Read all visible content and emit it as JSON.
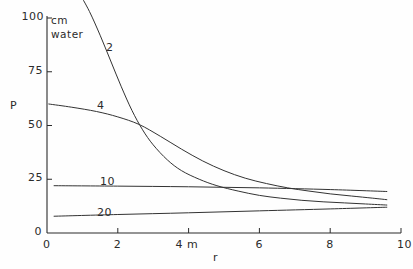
{
  "chart_data": {
    "type": "line",
    "title": "",
    "xlabel": "r",
    "ylabel": "P",
    "x_unit": "m",
    "y_unit": "cm water",
    "xlim": [
      0,
      10
    ],
    "ylim": [
      0,
      100
    ],
    "grid": false,
    "legend": "inline-curve-labels",
    "xticks": [
      "0",
      "2",
      "4 m",
      "6",
      "8",
      "10"
    ],
    "xtick_values": [
      0,
      2,
      4,
      6,
      8,
      10
    ],
    "yticks": [
      "0",
      "25",
      "50",
      "75",
      "100"
    ],
    "ytick_values": [
      0,
      25,
      50,
      75,
      100
    ],
    "series": [
      {
        "name": "2",
        "label": "2",
        "x": [
          0.9,
          1.2,
          1.5,
          1.8,
          2.1,
          2.4,
          2.7,
          3.0,
          3.4,
          3.8,
          4.3,
          4.8,
          5.4,
          6.0,
          6.6,
          7.2,
          7.8,
          8.4,
          9.0,
          9.6
        ],
        "y": [
          112,
          103,
          92,
          80,
          68,
          57,
          48,
          41,
          34,
          29,
          25,
          22,
          19.5,
          17.5,
          16.2,
          15.2,
          14.5,
          14.0,
          13.5,
          13.0
        ]
      },
      {
        "name": "4",
        "label": "4",
        "x": [
          0.05,
          0.7,
          1.4,
          2.0,
          2.6,
          3.2,
          3.8,
          4.4,
          5.0,
          5.6,
          6.2,
          6.8,
          7.4,
          8.0,
          8.6,
          9.2,
          9.6
        ],
        "y": [
          60,
          58.5,
          56.5,
          54,
          50.5,
          45,
          39,
          33.5,
          29,
          25.5,
          23,
          21,
          19.5,
          18.2,
          17.2,
          16.2,
          15.5
        ]
      },
      {
        "name": "10",
        "label": "10",
        "x": [
          0.2,
          2.0,
          4.0,
          6.0,
          8.0,
          9.6
        ],
        "y": [
          22.0,
          21.8,
          21.5,
          21.0,
          20.2,
          19.3
        ]
      },
      {
        "name": "20",
        "label": "20",
        "x": [
          0.2,
          2.0,
          4.0,
          6.0,
          8.0,
          9.6
        ],
        "y": [
          7.8,
          8.6,
          9.4,
          10.3,
          11.2,
          12.0
        ]
      }
    ]
  },
  "axes": {
    "y_unit_line1": "cm",
    "y_unit_line2": "water",
    "y_axis_label": "P",
    "x_axis_label": "r"
  },
  "colors": {
    "ink": "#2b2b2b",
    "background": "#fefefe",
    "curve": "#333333"
  }
}
